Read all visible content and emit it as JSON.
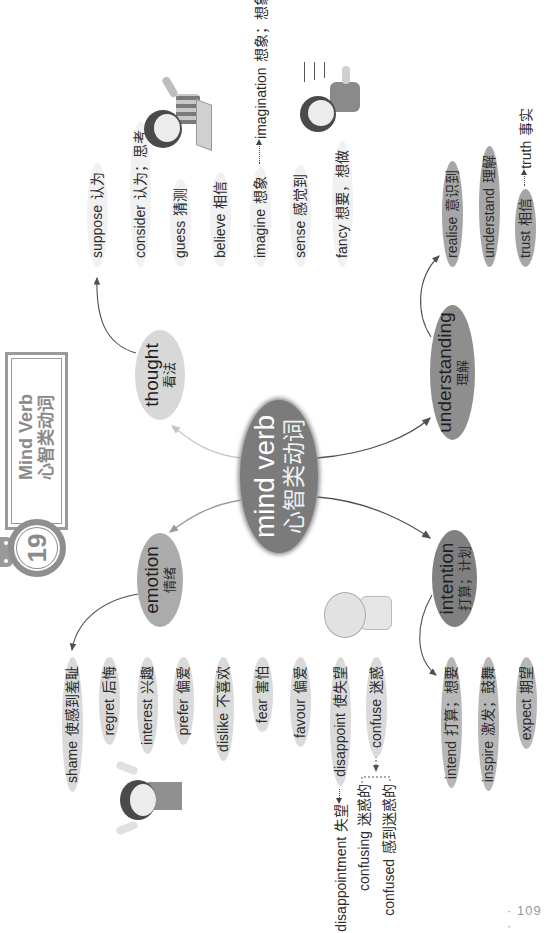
{
  "header": {
    "unit_number": "19",
    "title_en": "Mind Verb",
    "title_zh": "心智类动词"
  },
  "center": {
    "en": "mind verb",
    "zh": "心智类动词",
    "color": "#7b7b7b"
  },
  "branches": {
    "thought": {
      "en": "thought",
      "zh": "看法",
      "color": "#d8d8d8",
      "children": [
        {
          "en": "suppose",
          "zh": "认为"
        },
        {
          "en": "consider",
          "zh": "认为；思考"
        },
        {
          "en": "guess",
          "zh": "猜测"
        },
        {
          "en": "believe",
          "zh": "相信"
        },
        {
          "en": "imagine",
          "zh": "想象",
          "derived": {
            "en": "imagination",
            "zh": "想象；想象力"
          }
        },
        {
          "en": "sense",
          "zh": "感觉到"
        },
        {
          "en": "fancy",
          "zh": "想要，想做"
        }
      ]
    },
    "emotion": {
      "en": "emotion",
      "zh": "情绪",
      "color": "#ababab",
      "children": [
        {
          "en": "shame",
          "zh": "使感到羞耻"
        },
        {
          "en": "regret",
          "zh": "后悔"
        },
        {
          "en": "interest",
          "zh": "兴趣"
        },
        {
          "en": "prefer",
          "zh": "偏爱"
        },
        {
          "en": "dislike",
          "zh": "不喜欢"
        },
        {
          "en": "fear",
          "zh": "害怕"
        },
        {
          "en": "favour",
          "zh": "偏爱"
        },
        {
          "en": "disappoint",
          "zh": "使失望",
          "derived": {
            "en": "disappointment",
            "zh": "失望"
          }
        },
        {
          "en": "confuse",
          "zh": "迷惑",
          "derived": [
            {
              "en": "confusing",
              "zh": "迷惑的"
            },
            {
              "en": "confused",
              "zh": "感到迷惑的"
            }
          ]
        }
      ]
    },
    "understanding": {
      "en": "understanding",
      "zh": "理解",
      "color": "#8e8e8e",
      "children": [
        {
          "en": "realise",
          "zh": "意识到"
        },
        {
          "en": "understand",
          "zh": "理解"
        },
        {
          "en": "trust",
          "zh": "相信",
          "derived": {
            "en": "truth",
            "zh": "事实"
          }
        }
      ]
    },
    "intention": {
      "en": "intention",
      "zh": "打算；计划",
      "color": "#808080",
      "children": [
        {
          "en": "intend",
          "zh": "打算；想要"
        },
        {
          "en": "inspire",
          "zh": "激发；鼓舞"
        },
        {
          "en": "expect",
          "zh": "期望"
        }
      ]
    }
  },
  "page_number": "· 109 ·"
}
